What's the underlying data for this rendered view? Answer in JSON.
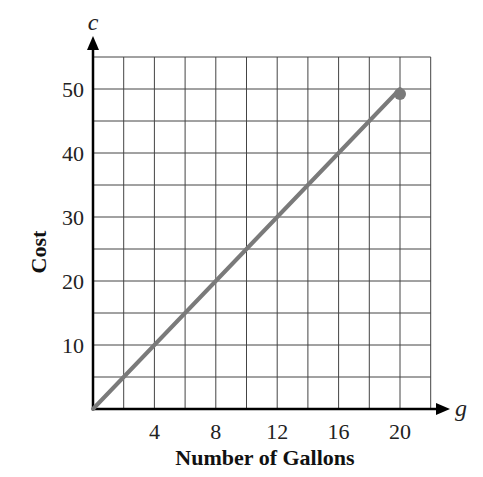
{
  "chart_data": {
    "type": "line",
    "title": "",
    "xlabel": "Number of Gallons",
    "ylabel": "Cost",
    "x_variable": "g",
    "y_variable": "c",
    "xlim": [
      0,
      22
    ],
    "ylim": [
      0,
      55
    ],
    "x_ticks": [
      4,
      8,
      12,
      16,
      20
    ],
    "y_ticks": [
      10,
      20,
      30,
      40,
      50
    ],
    "x_grid_step": 2,
    "y_grid_step": 5,
    "grid": true,
    "legend": null,
    "series": [
      {
        "name": "Cost",
        "x": [
          0,
          4,
          8,
          12,
          16,
          20
        ],
        "values": [
          0,
          10,
          20,
          30,
          40,
          50
        ],
        "endpoint_marker": {
          "x": 20,
          "y": 50,
          "style": "closed-dot"
        }
      }
    ],
    "colors": {
      "line": "#7a7a7a",
      "grid": "#444444",
      "axis": "#000000"
    }
  }
}
